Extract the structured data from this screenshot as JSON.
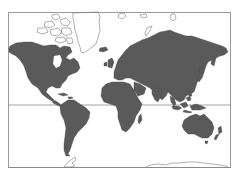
{
  "map": {
    "type": "world-map",
    "projection": "mercator",
    "style": "grayscale",
    "colors": {
      "background": "#ffffff",
      "land_fill": "#5a5a5a",
      "land_stroke": "#444444",
      "outline_land_stroke": "#7a7a7a",
      "frame": "#9a9a9a",
      "equator": "#8a8a8a"
    },
    "frame": {
      "x": 8,
      "y": 12,
      "width": 223,
      "height": 156
    },
    "lines": [
      {
        "name": "equator",
        "y": 105
      },
      {
        "name": "bottom-rule",
        "y": 168
      }
    ],
    "filled_regions": [
      "north-america",
      "central-america",
      "caribbean-islands",
      "south-america",
      "iceland",
      "europe",
      "british-isles",
      "africa",
      "madagascar",
      "asia",
      "japan",
      "indonesia",
      "philippines",
      "new-guinea",
      "australia",
      "new-zealand"
    ],
    "outlined_regions": [
      "greenland",
      "canadian-arctic-archipelago",
      "svalbard",
      "novaya-zemlya",
      "severnaya-zemlya",
      "antarctica-peninsula",
      "antarctica-coast"
    ]
  }
}
